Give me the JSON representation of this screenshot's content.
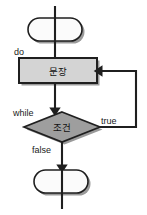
{
  "diagram": {
    "language": "ko",
    "canvas": {
      "width": 147,
      "height": 215,
      "background": "#ffffff"
    },
    "colors": {
      "stroke": "#1f1f1f",
      "process_fill": "#d4d4d4",
      "decision_fill": "#9e9e9e",
      "terminal_fill": "#fbfbfb",
      "shadow": "#9a9a9a",
      "text": "#111111"
    },
    "nodes": {
      "entry_terminal": {
        "shape": "stadium",
        "label": "",
        "name": "entry-terminal"
      },
      "process": {
        "shape": "rectangle",
        "label": "문장",
        "name": "process-statement"
      },
      "decision": {
        "shape": "diamond",
        "label": "조건",
        "name": "decision-condition"
      },
      "exit_terminal": {
        "shape": "stadium",
        "label": "",
        "name": "exit-terminal"
      }
    },
    "edge_labels": {
      "do": "do",
      "while": "while",
      "true": "true",
      "false": "false"
    }
  }
}
